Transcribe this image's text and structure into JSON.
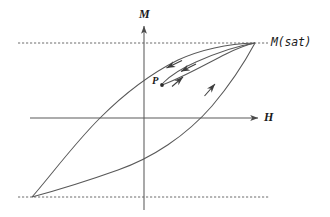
{
  "figure": {
    "kind": "hysteresis-loop-diagram",
    "background_color": "#ffffff",
    "ink_color": "#4a4a4a",
    "text_color": "#1a1a1a",
    "width": 330,
    "height": 217
  },
  "labels": {
    "m_axis": "M",
    "h_axis": "H",
    "saturation": "M(sat)",
    "point": "P"
  },
  "chart_data": {
    "type": "line",
    "title": "",
    "xlabel": "H",
    "ylabel": "M",
    "grid": false,
    "legend": null,
    "annotations": [
      {
        "name": "saturation-upper",
        "text": "M(sat)",
        "x": 255,
        "y": 43
      },
      {
        "name": "minor-loop-point",
        "text": "P",
        "x": 162,
        "y": 85
      }
    ],
    "axes": {
      "origin": {
        "x": 144,
        "y": 118
      },
      "h_axis": {
        "x_start": 30,
        "x_end": 262,
        "y": 118,
        "arrow": "right"
      },
      "m_axis": {
        "y_start": 22,
        "y_end": 210,
        "x": 144,
        "arrow": "up"
      }
    },
    "reference_lines": [
      {
        "name": "upper-saturation-line",
        "style": "dashed",
        "y": 43,
        "x_start": 18,
        "x_end": 268
      },
      {
        "name": "lower-saturation-line",
        "style": "dashed",
        "y": 197,
        "x_start": 18,
        "x_end": 270
      }
    ],
    "curves": [
      {
        "name": "descending-branch",
        "direction": "decreasing-H",
        "path": "M 255 43 C 225 44 200 50 178 60 C 150 74 122 96 100 118 C 74 144 52 174 32 197"
      },
      {
        "name": "ascending-branch",
        "direction": "increasing-H",
        "path": "M 32 197 C 58 190 90 180 118 170 C 152 158 186 136 212 106 C 234 80 248 56 255 43"
      },
      {
        "name": "minor-loop-return",
        "direction": "increasing-H",
        "path": "M 162 85 C 182 78 206 64 226 54 C 240 47 250 44 255 43"
      },
      {
        "name": "minor-loop-outward",
        "direction": "decreasing-H",
        "path": "M 255 43 C 236 46 214 54 196 62 C 180 69 170 76 163 83"
      }
    ],
    "arrows": [
      {
        "name": "arrow-descending-left",
        "x": 170,
        "y": 66,
        "angle": 210
      },
      {
        "name": "arrow-minor-return-left",
        "x": 184,
        "y": 70,
        "angle": 208
      },
      {
        "name": "arrow-minor-up",
        "x": 181,
        "y": 79,
        "angle": 330
      },
      {
        "name": "arrow-ascending-up",
        "x": 213,
        "y": 86,
        "angle": 315
      }
    ]
  }
}
